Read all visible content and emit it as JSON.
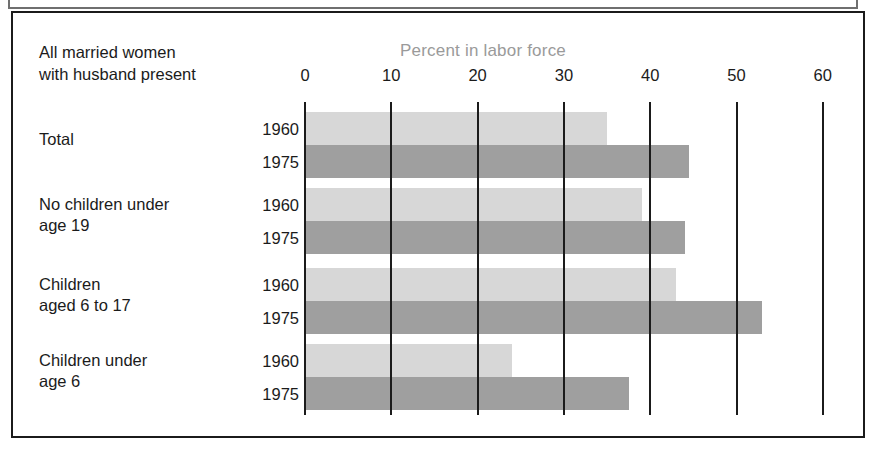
{
  "figure": {
    "corner_label_line1": "All married women",
    "corner_label_line2": "with husband present",
    "title": "Percent in labor force"
  },
  "colors": {
    "bar_1960": "#d7d7d7",
    "bar_1975": "#9f9f9f",
    "title_text": "#9a9a9a",
    "axis": "#1b1b1b",
    "frame": "#1b1b1b"
  },
  "axis": {
    "ticks": [
      "0",
      "10",
      "20",
      "30",
      "40",
      "50",
      "60"
    ],
    "min": 0,
    "max": 60,
    "step": 10
  },
  "groups": [
    {
      "label_line1": "Total",
      "label_line2": "",
      "rows": [
        {
          "year": "1960",
          "value": 35.0
        },
        {
          "year": "1975",
          "value": 44.5
        }
      ]
    },
    {
      "label_line1": "No children under",
      "label_line2": "age 19",
      "rows": [
        {
          "year": "1960",
          "value": 39.0
        },
        {
          "year": "1975",
          "value": 44.0
        }
      ]
    },
    {
      "label_line1": "Children",
      "label_line2": "aged 6 to 17",
      "rows": [
        {
          "year": "1960",
          "value": 43.0
        },
        {
          "year": "1975",
          "value": 53.0
        }
      ]
    },
    {
      "label_line1": "Children under",
      "label_line2": "age 6",
      "rows": [
        {
          "year": "1960",
          "value": 24.0
        },
        {
          "year": "1975",
          "value": 37.5
        }
      ]
    }
  ],
  "chart_data": {
    "type": "bar",
    "orientation": "horizontal",
    "title": "Percent in labor force",
    "subtitle": "All married women with husband present",
    "xlabel": "Percent in labor force",
    "ylabel": "",
    "xlim": [
      0,
      60
    ],
    "xticks": [
      0,
      10,
      20,
      30,
      40,
      50,
      60
    ],
    "grid": true,
    "legend": "none",
    "categories": [
      "Total",
      "No children under age 19",
      "Children aged 6 to 17",
      "Children under age 6"
    ],
    "series": [
      {
        "name": "1960",
        "values": [
          35.0,
          39.0,
          43.0,
          24.0
        ],
        "color": "#d7d7d7"
      },
      {
        "name": "1975",
        "values": [
          44.5,
          44.0,
          53.0,
          37.5
        ],
        "color": "#9f9f9f"
      }
    ]
  }
}
